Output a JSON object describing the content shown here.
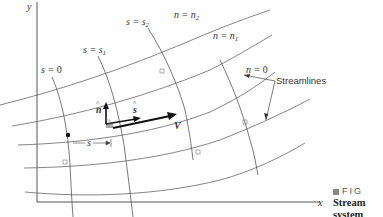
{
  "diagram": {
    "axes": {
      "x_label": "x",
      "y_label": "y"
    },
    "s_lines": [
      {
        "label": "s = 0",
        "var": "s",
        "eq": "=",
        "val": "0"
      },
      {
        "label": "s = s1",
        "var": "s",
        "eq": "=",
        "val": "s",
        "sub": "1"
      },
      {
        "label": "s = s2",
        "var": "s",
        "eq": "=",
        "val": "s",
        "sub": "2"
      }
    ],
    "n_lines": [
      {
        "label": "n = n2",
        "var": "n",
        "eq": "=",
        "val": "n",
        "sub": "2"
      },
      {
        "label": "n = n1",
        "var": "n",
        "eq": "=",
        "val": "n",
        "sub": "1"
      },
      {
        "label": "n = 0",
        "var": "n",
        "eq": "=",
        "val": "0"
      }
    ],
    "streamlines_label": "Streamlines",
    "vectors": {
      "n_hat": "n",
      "s_hat": "s",
      "velocity": "V"
    },
    "distance_label": "s"
  },
  "caption": {
    "figure_prefix": "FIG",
    "lines": [
      "Stream",
      "system",
      "dimens"
    ]
  },
  "colors": {
    "line": "#555555",
    "text": "#333333",
    "vector": "#111111",
    "marker": "#999999"
  }
}
